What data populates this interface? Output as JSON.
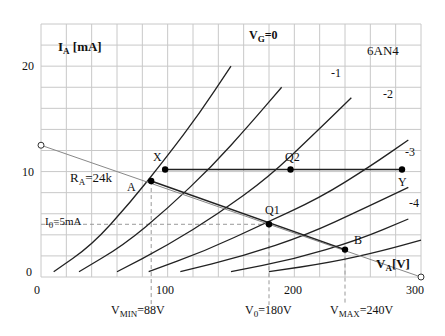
{
  "chart_data": {
    "type": "line",
    "title": "6AN4",
    "xlabel": "V_A[V]",
    "ylabel": "I_A [mA]",
    "xlim": [
      0,
      300
    ],
    "ylim": [
      0,
      24
    ],
    "x_ticks": [
      "0",
      "100",
      "200",
      "300"
    ],
    "y_ticks": [
      "0",
      "10",
      "20"
    ],
    "grid": true,
    "grid_step_x": 20,
    "grid_step_y": 2,
    "series": [
      {
        "name": "V_G=0",
        "points": [
          [
            10,
            0.5
          ],
          [
            40,
            3
          ],
          [
            70,
            7
          ],
          [
            100,
            11.5
          ],
          [
            125,
            15.5
          ],
          [
            150,
            20
          ]
        ]
      },
      {
        "name": "-1",
        "points": [
          [
            30,
            0.5
          ],
          [
            65,
            3
          ],
          [
            100,
            6.5
          ],
          [
            135,
            10.5
          ],
          [
            165,
            14.5
          ],
          [
            190,
            18
          ]
        ]
      },
      {
        "name": "-2",
        "points": [
          [
            60,
            0.5
          ],
          [
            100,
            3
          ],
          [
            140,
            6
          ],
          [
            180,
            9.5
          ],
          [
            215,
            13.5
          ],
          [
            245,
            17
          ]
        ]
      },
      {
        "name": "-3",
        "points": [
          [
            85,
            0.5
          ],
          [
            130,
            2.5
          ],
          [
            175,
            5
          ],
          [
            220,
            7.5
          ],
          [
            260,
            10.5
          ],
          [
            290,
            13
          ]
        ]
      },
      {
        "name": "-4",
        "points": [
          [
            110,
            0.5
          ],
          [
            160,
            2
          ],
          [
            210,
            4
          ],
          [
            255,
            6.5
          ],
          [
            290,
            8.5
          ]
        ]
      },
      {
        "name": "-5",
        "points": [
          [
            150,
            0.5
          ],
          [
            200,
            1.7
          ],
          [
            250,
            3.5
          ],
          [
            290,
            5.5
          ]
        ]
      },
      {
        "name": "-6",
        "points": [
          [
            180,
            0.5
          ],
          [
            230,
            1.4
          ],
          [
            270,
            2.5
          ],
          [
            300,
            3.5
          ]
        ]
      }
    ],
    "load_line": {
      "label": "R_A=24k",
      "from": [
        0,
        12.5
      ],
      "to": [
        300,
        0
      ]
    },
    "horizontal_line": {
      "from": [
        98,
        10.2
      ],
      "to": [
        285,
        10.2
      ]
    },
    "points": [
      {
        "label": "A",
        "x": 87,
        "y": 9.1
      },
      {
        "label": "X",
        "x": 98,
        "y": 10.2
      },
      {
        "label": "Q1",
        "x": 180,
        "y": 5
      },
      {
        "label": "Q2",
        "x": 197,
        "y": 10.2
      },
      {
        "label": "Y",
        "x": 285,
        "y": 10.2
      },
      {
        "label": "B",
        "x": 240,
        "y": 2.6
      }
    ],
    "annotations": [
      "V_MIN=88V",
      "V_0=180V",
      "V_MAX=240V",
      "I_0=5mA",
      "R_A=24k"
    ]
  },
  "labels": {
    "ylabel_main": "I",
    "ylabel_sub": "A",
    "ylabel_unit": " [mA]",
    "xlabel_main": "V",
    "xlabel_sub": "A",
    "xlabel_unit": "[V]",
    "vg0_main": "V",
    "vg0_sub": "G",
    "vg0_val": "=0",
    "tube": "6AN4",
    "g1": "-1",
    "g2": "-2",
    "g3": "-3",
    "g4": "-4",
    "y20": "20",
    "y10": "10",
    "y0": "0",
    "x0": "0",
    "x100": "100",
    "x200": "200",
    "x300": "300",
    "ra_main": "R",
    "ra_sub": "A",
    "ra_val": "=24k",
    "i0_main": "I",
    "i0_sub": "0",
    "i0_val": "=5mA",
    "pA": "A",
    "pX": "X",
    "pQ1": "Q1",
    "pQ2": "Q2",
    "pY": "Y",
    "pB": "B",
    "vmin_main": "V",
    "vmin_sub": "MIN",
    "vmin_val": "=88V",
    "v0_main": "V",
    "v0_sub": "0",
    "v0_val": "=180V",
    "vmax_main": "V",
    "vmax_sub": "MAX",
    "vmax_val": "=240V"
  }
}
